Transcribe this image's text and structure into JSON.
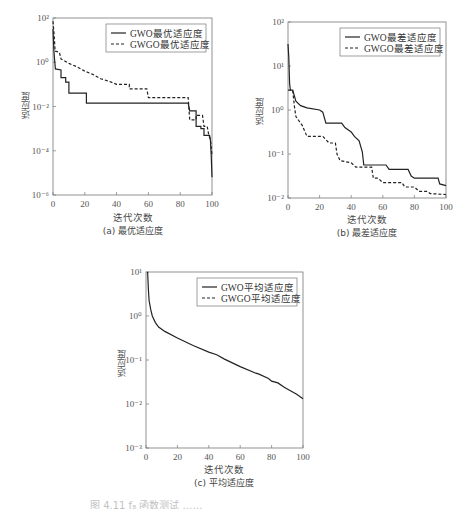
{
  "chart_data": [
    {
      "id": "a",
      "type": "line",
      "title": "",
      "caption": "(a) 最优适应度",
      "xlabel": "迭代次数",
      "ylabel": "适应度",
      "yscale": "log",
      "xlim": [
        0,
        100
      ],
      "ylim_exp": [
        -6,
        2
      ],
      "xticks": [
        0,
        20,
        40,
        60,
        80,
        100
      ],
      "yticks_exp": [
        2,
        0,
        -2,
        -4,
        -6
      ],
      "legend_position": "upper right",
      "frame": {
        "left": 53,
        "top": 18,
        "right": 212,
        "bottom": 195
      },
      "series": [
        {
          "name": "GWO最优适应度",
          "style": "solid",
          "points_log10": [
            [
              0,
              1.5
            ],
            [
              0.5,
              0.6
            ],
            [
              1,
              0.1
            ],
            [
              1.5,
              -0.3
            ],
            [
              5,
              -0.35
            ],
            [
              5,
              -0.7
            ],
            [
              8,
              -0.7
            ],
            [
              8,
              -0.9
            ],
            [
              10,
              -0.9
            ],
            [
              10,
              -1.4
            ],
            [
              21,
              -1.4
            ],
            [
              21,
              -1.85
            ],
            [
              85,
              -1.85
            ],
            [
              86,
              -2.2
            ],
            [
              90,
              -2.2
            ],
            [
              90,
              -2.9
            ],
            [
              93,
              -2.9
            ],
            [
              93,
              -3.0
            ],
            [
              95,
              -3.0
            ],
            [
              95,
              -3.3
            ],
            [
              98.5,
              -3.3
            ],
            [
              99,
              -3.5
            ],
            [
              99.5,
              -4.2
            ],
            [
              100,
              -5.2
            ]
          ]
        },
        {
          "name": "GWGO最优适应度",
          "style": "dashed",
          "points_log10": [
            [
              0,
              1.85
            ],
            [
              0.6,
              1.3
            ],
            [
              1,
              0.9
            ],
            [
              1.3,
              0.5
            ],
            [
              4,
              0.45
            ],
            [
              5,
              0.15
            ],
            [
              10,
              -0.05
            ],
            [
              15,
              -0.2
            ],
            [
              20,
              -0.4
            ],
            [
              25,
              -0.55
            ],
            [
              30,
              -0.75
            ],
            [
              35,
              -0.85
            ],
            [
              40,
              -1.0
            ],
            [
              48,
              -1.0
            ],
            [
              48,
              -1.2
            ],
            [
              59,
              -1.2
            ],
            [
              60,
              -1.6
            ],
            [
              85,
              -1.6
            ],
            [
              86,
              -2.6
            ],
            [
              90,
              -2.6
            ],
            [
              90,
              -2.4
            ],
            [
              94,
              -2.4
            ],
            [
              95,
              -2.9
            ],
            [
              97,
              -2.9
            ],
            [
              98,
              -3.3
            ],
            [
              99,
              -3.5
            ],
            [
              100,
              -4.2
            ]
          ]
        }
      ]
    },
    {
      "id": "b",
      "type": "line",
      "title": "",
      "caption": "(b) 最差适应度",
      "xlabel": "迭代次数",
      "ylabel": "适应度",
      "yscale": "log",
      "xlim": [
        0,
        100
      ],
      "ylim_exp": [
        -2,
        2
      ],
      "xticks": [
        0,
        20,
        40,
        60,
        80,
        100
      ],
      "yticks_exp": [
        2,
        1,
        0,
        -1,
        -2
      ],
      "legend_position": "upper right",
      "frame": {
        "left": 288,
        "top": 22,
        "right": 446,
        "bottom": 198
      },
      "series": [
        {
          "name": "GWO最差适应度",
          "style": "solid",
          "points_log10": [
            [
              0,
              1.5
            ],
            [
              0.5,
              1.2
            ],
            [
              1,
              0.6
            ],
            [
              1.5,
              0.45
            ],
            [
              3,
              0.45
            ],
            [
              5,
              0.2
            ],
            [
              8,
              0.1
            ],
            [
              12,
              0.05
            ],
            [
              20,
              0.0
            ],
            [
              22,
              -0.05
            ],
            [
              24,
              -0.3
            ],
            [
              34,
              -0.3
            ],
            [
              36,
              -0.4
            ],
            [
              40,
              -0.5
            ],
            [
              42,
              -0.6
            ],
            [
              45,
              -0.7
            ],
            [
              47,
              -0.95
            ],
            [
              48,
              -1.25
            ],
            [
              62,
              -1.25
            ],
            [
              64,
              -1.35
            ],
            [
              76,
              -1.35
            ],
            [
              78,
              -1.5
            ],
            [
              80,
              -1.55
            ],
            [
              95,
              -1.55
            ],
            [
              96,
              -1.68
            ],
            [
              100,
              -1.72
            ]
          ]
        },
        {
          "name": "GWGO最差适应度",
          "style": "dashed",
          "points_log10": [
            [
              0,
              0.45
            ],
            [
              3,
              0.45
            ],
            [
              4,
              0.1
            ],
            [
              5,
              -0.15
            ],
            [
              7,
              -0.25
            ],
            [
              9,
              -0.35
            ],
            [
              12,
              -0.6
            ],
            [
              22,
              -0.6
            ],
            [
              26,
              -0.75
            ],
            [
              30,
              -0.75
            ],
            [
              31,
              -1.0
            ],
            [
              33,
              -1.15
            ],
            [
              40,
              -1.2
            ],
            [
              43,
              -1.3
            ],
            [
              53,
              -1.3
            ],
            [
              54,
              -1.55
            ],
            [
              57,
              -1.55
            ],
            [
              60,
              -1.65
            ],
            [
              72,
              -1.65
            ],
            [
              74,
              -1.75
            ],
            [
              80,
              -1.75
            ],
            [
              83,
              -1.85
            ],
            [
              88,
              -1.85
            ],
            [
              90,
              -1.9
            ],
            [
              100,
              -1.92
            ]
          ]
        }
      ]
    },
    {
      "id": "c",
      "type": "line",
      "title": "",
      "caption": "(c) 平均适应度",
      "xlabel": "迭代次数",
      "ylabel": "适应度",
      "yscale": "log",
      "xlim": [
        0,
        100
      ],
      "ylim_exp": [
        -3,
        1
      ],
      "xticks": [
        0,
        20,
        40,
        60,
        80,
        100
      ],
      "yticks_exp": [
        1,
        0,
        -1,
        -2,
        -3
      ],
      "legend_position": "upper right",
      "frame": {
        "left": 146,
        "top": 272,
        "right": 303,
        "bottom": 448
      },
      "series": [
        {
          "name": "GWO平均适应度",
          "style": "solid",
          "points_log10": [
            [
              1,
              1.0
            ],
            [
              1.5,
              0.6
            ],
            [
              2,
              0.35
            ],
            [
              3,
              0.15
            ],
            [
              4,
              0.0
            ],
            [
              6,
              -0.15
            ],
            [
              8,
              -0.25
            ],
            [
              12,
              -0.35
            ],
            [
              20,
              -0.5
            ],
            [
              30,
              -0.67
            ],
            [
              40,
              -0.82
            ],
            [
              45,
              -0.88
            ],
            [
              50,
              -0.98
            ],
            [
              60,
              -1.15
            ],
            [
              70,
              -1.3
            ],
            [
              72,
              -1.32
            ],
            [
              78,
              -1.42
            ],
            [
              80,
              -1.48
            ],
            [
              84,
              -1.52
            ],
            [
              88,
              -1.62
            ],
            [
              92,
              -1.7
            ],
            [
              96,
              -1.78
            ],
            [
              100,
              -1.88
            ]
          ]
        },
        {
          "name": "GWGO平均适应度",
          "style": "dashed",
          "points_log10": []
        }
      ]
    }
  ],
  "figure": {
    "bottom_caption_partial": "图 4.11  f₈ 函数测试 ……"
  }
}
